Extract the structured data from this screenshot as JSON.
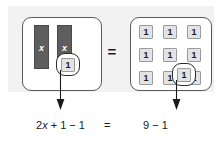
{
  "figure": {
    "kind": "algebra-tile-balance-model",
    "panel_background": "#f2f2f2"
  },
  "model": {
    "left_group": {
      "label": "left-side-tiles",
      "x_tiles": [
        {
          "label": "x"
        },
        {
          "label": "x"
        }
      ],
      "unit_tiles": [
        {
          "label": "1",
          "circled": true
        }
      ]
    },
    "equals": "=",
    "right_group": {
      "label": "right-side-tiles",
      "unit_grid": [
        [
          {
            "label": "1",
            "circled": false
          },
          {
            "label": "1",
            "circled": false
          },
          {
            "label": "1",
            "circled": false
          }
        ],
        [
          {
            "label": "1",
            "circled": false
          },
          {
            "label": "1",
            "circled": false
          },
          {
            "label": "1",
            "circled": false
          }
        ],
        [
          {
            "label": "1",
            "circled": false
          },
          {
            "label": "1",
            "circled": false
          },
          {
            "label": "1",
            "circled": true
          }
        ]
      ]
    }
  },
  "annotations": {
    "arrow_left": "down-arrow",
    "arrow_right": "down-arrow"
  },
  "equation": {
    "left_prefix": "2",
    "left_variable": "x",
    "left_suffix": " + 1 − 1",
    "left_full": "2x + 1 − 1",
    "relation": "=",
    "right": "9 − 1"
  },
  "colors": {
    "x_tile_fill": "#5e5e5e",
    "x_tile_text": "#ffffff",
    "unit_tile_fill": "#e3e3e3",
    "unit_tile_border": "#9a9a9a",
    "group_border": "#5a5a5a",
    "circle_border": "#2b2b2b",
    "text": "#1a1a1a"
  }
}
